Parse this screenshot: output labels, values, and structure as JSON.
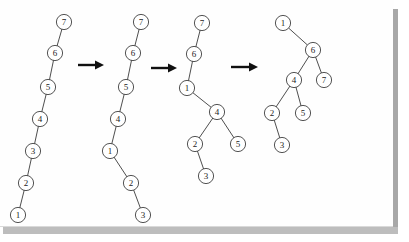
{
  "figure": {
    "background_color": "#ffffff",
    "page_color": "#fefefe",
    "shadow_color": "#a8a8a8",
    "node_fill": "#ffffff",
    "node_stroke": "#3f3f3f",
    "edge_color": "#3a3a3a",
    "arrow_color": "#101010",
    "node_radius": 7.6,
    "canvas": {
      "width": 409,
      "height": 242
    }
  },
  "trees": [
    {
      "name": "tree-1",
      "caption": "Initial left-leaning chain",
      "nodes": [
        {
          "id": "t1n7",
          "label": "7",
          "x": 64,
          "y": 22
        },
        {
          "id": "t1n6",
          "label": "6",
          "x": 55,
          "y": 53
        },
        {
          "id": "t1n5",
          "label": "5",
          "x": 48,
          "y": 87
        },
        {
          "id": "t1n4",
          "label": "4",
          "x": 40,
          "y": 119
        },
        {
          "id": "t1n3",
          "label": "3",
          "x": 33,
          "y": 151
        },
        {
          "id": "t1n2",
          "label": "2",
          "x": 26,
          "y": 183
        },
        {
          "id": "t1n1",
          "label": "1",
          "x": 18,
          "y": 215
        }
      ],
      "edges": [
        {
          "from": "t1n7",
          "to": "t1n6"
        },
        {
          "from": "t1n6",
          "to": "t1n5"
        },
        {
          "from": "t1n5",
          "to": "t1n4"
        },
        {
          "from": "t1n4",
          "to": "t1n3"
        },
        {
          "from": "t1n3",
          "to": "t1n2"
        },
        {
          "from": "t1n2",
          "to": "t1n1"
        }
      ]
    },
    {
      "name": "tree-2",
      "caption": "After first rotation at node 1",
      "nodes": [
        {
          "id": "t2n7",
          "label": "7",
          "x": 141,
          "y": 22
        },
        {
          "id": "t2n6",
          "label": "6",
          "x": 133,
          "y": 53
        },
        {
          "id": "t2n5",
          "label": "5",
          "x": 126,
          "y": 87
        },
        {
          "id": "t2n4",
          "label": "4",
          "x": 118,
          "y": 119
        },
        {
          "id": "t2n1",
          "label": "1",
          "x": 110,
          "y": 151
        },
        {
          "id": "t2n2",
          "label": "2",
          "x": 131,
          "y": 183
        },
        {
          "id": "t2n3",
          "label": "3",
          "x": 143,
          "y": 215
        }
      ],
      "edges": [
        {
          "from": "t2n7",
          "to": "t2n6"
        },
        {
          "from": "t2n6",
          "to": "t2n5"
        },
        {
          "from": "t2n5",
          "to": "t2n4"
        },
        {
          "from": "t2n4",
          "to": "t2n1"
        },
        {
          "from": "t2n1",
          "to": "t2n2"
        },
        {
          "from": "t2n2",
          "to": "t2n3"
        }
      ]
    },
    {
      "name": "tree-3",
      "caption": "After second rotation lifting node 1",
      "nodes": [
        {
          "id": "t3n7",
          "label": "7",
          "x": 202,
          "y": 23
        },
        {
          "id": "t3n6",
          "label": "6",
          "x": 194,
          "y": 54
        },
        {
          "id": "t3n1",
          "label": "1",
          "x": 187,
          "y": 88
        },
        {
          "id": "t3n4",
          "label": "4",
          "x": 217,
          "y": 112
        },
        {
          "id": "t3n2",
          "label": "2",
          "x": 195,
          "y": 144
        },
        {
          "id": "t3n5",
          "label": "5",
          "x": 238,
          "y": 144
        },
        {
          "id": "t3n3",
          "label": "3",
          "x": 206,
          "y": 176
        }
      ],
      "edges": [
        {
          "from": "t3n7",
          "to": "t3n6"
        },
        {
          "from": "t3n6",
          "to": "t3n1"
        },
        {
          "from": "t3n1",
          "to": "t3n4"
        },
        {
          "from": "t3n4",
          "to": "t3n2"
        },
        {
          "from": "t3n4",
          "to": "t3n5"
        },
        {
          "from": "t3n2",
          "to": "t3n3"
        }
      ]
    },
    {
      "name": "tree-4",
      "caption": "Final balanced tree rooted at node 1",
      "nodes": [
        {
          "id": "t4n1",
          "label": "1",
          "x": 283,
          "y": 23
        },
        {
          "id": "t4n6",
          "label": "6",
          "x": 313,
          "y": 50
        },
        {
          "id": "t4n4",
          "label": "4",
          "x": 294,
          "y": 80
        },
        {
          "id": "t4n7",
          "label": "7",
          "x": 324,
          "y": 80
        },
        {
          "id": "t4n2",
          "label": "2",
          "x": 272,
          "y": 113
        },
        {
          "id": "t4n5",
          "label": "5",
          "x": 303,
          "y": 113
        },
        {
          "id": "t4n3",
          "label": "3",
          "x": 282,
          "y": 145
        }
      ],
      "edges": [
        {
          "from": "t4n1",
          "to": "t4n6"
        },
        {
          "from": "t4n6",
          "to": "t4n4"
        },
        {
          "from": "t4n6",
          "to": "t4n7"
        },
        {
          "from": "t4n4",
          "to": "t4n2"
        },
        {
          "from": "t4n4",
          "to": "t4n5"
        },
        {
          "from": "t4n2",
          "to": "t4n3"
        }
      ]
    }
  ],
  "arrows": [
    {
      "name": "arrow-1",
      "label": "transform",
      "x1": 78,
      "y1": 65,
      "x2": 104,
      "y2": 65
    },
    {
      "name": "arrow-2",
      "label": "transform",
      "x1": 151,
      "y1": 68,
      "x2": 177,
      "y2": 68
    },
    {
      "name": "arrow-3",
      "label": "transform",
      "x1": 231,
      "y1": 67,
      "x2": 258,
      "y2": 67
    }
  ]
}
